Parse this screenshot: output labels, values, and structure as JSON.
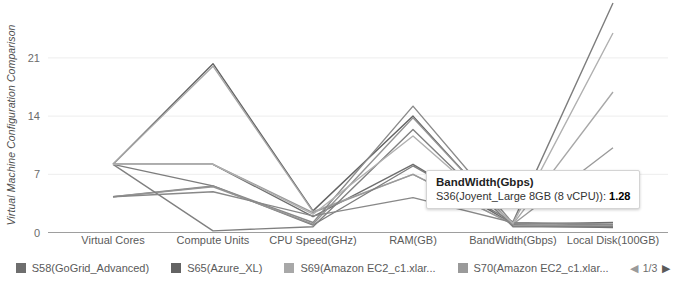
{
  "chart_data": {
    "type": "line",
    "title": "",
    "ylabel": "Virtual Machine Configuration Comparison",
    "xlabel": "",
    "grid": true,
    "legend_position": "bottom",
    "ylim": [
      0,
      28
    ],
    "yticks": [
      "0",
      "7",
      "14",
      "21"
    ],
    "ytick_values": [
      0,
      7,
      14,
      21
    ],
    "categories": [
      "Virtual Cores",
      "Compute Units",
      "CPU Speed(GHz)",
      "RAM(GB)",
      "BandWidth(Gbps)",
      "Local Disk(100GB)"
    ],
    "series": [
      {
        "name": "S58(GoGrid_Advanced)",
        "color": "#6e6e6e",
        "values": [
          8.2,
          8.2,
          1.9,
          8.2,
          1.0,
          1.2
        ]
      },
      {
        "name": "S65(Azure_XL)",
        "color": "#636363",
        "values": [
          8.2,
          20.3,
          2.6,
          14.0,
          0.8,
          0.6
        ]
      },
      {
        "name": "S69(Amazon EC2_c1.xlar...",
        "color": "#a8a8a8",
        "values": [
          8.2,
          20.0,
          2.5,
          7.0,
          1.0,
          16.9
        ]
      },
      {
        "name": "S70(Amazon EC2_c1.xlar...",
        "color": "#9a9a9a",
        "values": [
          8.2,
          8.2,
          2.4,
          7.0,
          1.0,
          10.2
        ]
      },
      {
        "name": "S36(Joyent_Large 8GB (8 vCPU))",
        "color": "#7d7d7d",
        "values": [
          8.2,
          5.6,
          0.9,
          8.0,
          1.28,
          27.6
        ]
      },
      {
        "name": "Series 6",
        "color": "#8a8a8a",
        "values": [
          4.3,
          5.6,
          1.2,
          15.2,
          1.1,
          0.9
        ]
      },
      {
        "name": "Series 7",
        "color": "#949494",
        "values": [
          4.3,
          5.5,
          1.0,
          13.8,
          0.9,
          0.8
        ]
      },
      {
        "name": "Series 8",
        "color": "#808080",
        "values": [
          8.2,
          0.2,
          0.7,
          12.4,
          0.7,
          0.7
        ]
      },
      {
        "name": "Series 9",
        "color": "#888888",
        "values": [
          4.3,
          4.9,
          2.0,
          4.2,
          1.2,
          1.0
        ]
      },
      {
        "name": "Series 10",
        "color": "#b0b0b0",
        "values": [
          8.2,
          8.2,
          2.2,
          11.6,
          1.1,
          24.0
        ]
      }
    ],
    "annotations": [
      {
        "axis": "BandWidth(Gbps)",
        "series": "S36(Joyent_Large 8GB (8 vCPU))",
        "value": 1.28
      }
    ]
  },
  "axis": {
    "y_title": "Virtual Machine Configuration Comparison",
    "tick_labels": [
      "21",
      "14",
      "7",
      "0"
    ]
  },
  "tooltip": {
    "title": "BandWidth(Gbps)",
    "series_label": "S36(Joyent_Large 8GB (8 vCPU)):",
    "value": "1.28"
  },
  "legend": {
    "items": [
      {
        "label": "S58(GoGrid_Advanced)",
        "color": "#6e6e6e"
      },
      {
        "label": "S65(Azure_XL)",
        "color": "#636363"
      },
      {
        "label": "S69(Amazon EC2_c1.xlar...",
        "color": "#a8a8a8"
      },
      {
        "label": "S70(Amazon EC2_c1.xlar...",
        "color": "#9a9a9a"
      }
    ],
    "pager": {
      "prev_icon": "◀",
      "next_icon": "▶",
      "text": "1/3"
    }
  }
}
